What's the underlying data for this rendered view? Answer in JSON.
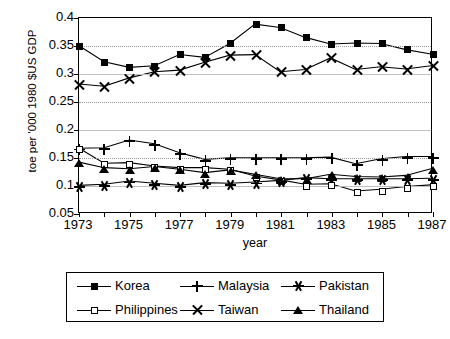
{
  "chart_data": {
    "type": "line",
    "title": "",
    "xlabel": "year",
    "ylabel": "toe per '000 1980 $US GDP",
    "x": [
      1973,
      1974,
      1975,
      1976,
      1977,
      1978,
      1979,
      1980,
      1981,
      1982,
      1983,
      1984,
      1985,
      1986,
      1987
    ],
    "xlim": [
      1973,
      1987
    ],
    "ylim": [
      0.05,
      0.4
    ],
    "xticks": [
      1973,
      1974,
      1975,
      1976,
      1977,
      1978,
      1979,
      1980,
      1981,
      1982,
      1983,
      1984,
      1985,
      1986,
      1987
    ],
    "xticklabels": [
      "1973",
      "",
      "1975",
      "",
      "1977",
      "",
      "1979",
      "",
      "1981",
      "",
      "1983",
      "",
      "1985",
      "",
      "1987"
    ],
    "xticklabels_shown": [
      "1973",
      "1975",
      "1977",
      "1979",
      "1981",
      "1983",
      "1985",
      "1987"
    ],
    "yticks": [
      0.05,
      0.1,
      0.15,
      0.2,
      0.25,
      0.3,
      0.35,
      0.4
    ],
    "yticklabels": [
      "0.05",
      "0.1",
      "0.15",
      "0.2",
      "0.25",
      "0.3",
      "0.35",
      "0.4"
    ],
    "grid": true,
    "legend_position": "below-outside",
    "series": [
      {
        "name": "Korea",
        "marker": "filled-square",
        "values": [
          0.35,
          0.321,
          0.311,
          0.314,
          0.334,
          0.329,
          0.354,
          0.389,
          0.383,
          0.365,
          0.353,
          0.355,
          0.354,
          0.343,
          0.335
        ]
      },
      {
        "name": "Malaysia",
        "marker": "plus",
        "values": [
          0.165,
          0.166,
          0.18,
          0.173,
          0.157,
          0.145,
          0.148,
          0.148,
          0.148,
          0.148,
          0.149,
          0.137,
          0.146,
          0.15,
          0.15
        ]
      },
      {
        "name": "Pakistan",
        "marker": "star",
        "values": [
          0.098,
          0.1,
          0.106,
          0.102,
          0.098,
          0.103,
          0.102,
          0.104,
          0.107,
          0.112,
          0.11,
          0.11,
          0.11,
          0.11,
          0.111
        ]
      },
      {
        "name": "Philippines",
        "marker": "open-square",
        "values": [
          0.165,
          0.138,
          0.139,
          0.133,
          0.13,
          0.13,
          0.127,
          0.115,
          0.108,
          0.1,
          0.101,
          0.088,
          0.091,
          0.096,
          0.099
        ]
      },
      {
        "name": "Taiwan",
        "marker": "x",
        "values": [
          0.281,
          0.277,
          0.292,
          0.303,
          0.306,
          0.32,
          0.333,
          0.334,
          0.303,
          0.307,
          0.328,
          0.307,
          0.312,
          0.308,
          0.314
        ]
      },
      {
        "name": "Thailand",
        "marker": "filled-triangle",
        "values": [
          0.14,
          0.13,
          0.128,
          0.132,
          0.127,
          0.121,
          0.126,
          0.118,
          0.11,
          0.11,
          0.118,
          0.114,
          0.113,
          0.116,
          0.128
        ]
      }
    ]
  },
  "legend": {
    "entries": [
      {
        "label": "Korea",
        "marker": "filled-square"
      },
      {
        "label": "Malaysia",
        "marker": "plus"
      },
      {
        "label": "Pakistan",
        "marker": "star"
      },
      {
        "label": "Philippines",
        "marker": "open-square"
      },
      {
        "label": "Taiwan",
        "marker": "x"
      },
      {
        "label": "Thailand",
        "marker": "filled-triangle"
      }
    ]
  },
  "colors": {
    "line": "#000000",
    "grid": "#bfbfbf",
    "axis": "#000000",
    "background": "#ffffff"
  }
}
